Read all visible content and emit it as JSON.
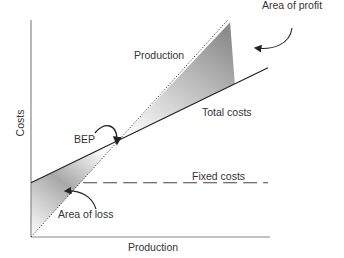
{
  "chart_data": {
    "type": "line",
    "title": "",
    "xlabel": "Production",
    "ylabel": "Costs",
    "grid": false,
    "xlim": [
      0,
      100
    ],
    "ylim": [
      0,
      100
    ],
    "series": [
      {
        "name": "Production",
        "style": "dotted",
        "points": [
          [
            0,
            0
          ],
          [
            83,
            100
          ]
        ]
      },
      {
        "name": "Total costs",
        "style": "solid",
        "points": [
          [
            0,
            25
          ],
          [
            100,
            78
          ]
        ]
      },
      {
        "name": "Fixed costs",
        "style": "dashed",
        "points": [
          [
            22,
            25
          ],
          [
            100,
            25
          ]
        ]
      }
    ],
    "regions": [
      {
        "name": "Area of loss",
        "between": [
          "Total costs",
          "Production"
        ],
        "x_range": [
          0,
          37
        ]
      },
      {
        "name": "Area of profit",
        "between": [
          "Production",
          "Total costs"
        ],
        "x_range": [
          37,
          86
        ]
      }
    ],
    "annotations": [
      {
        "text": "BEP",
        "target": "break-even point",
        "at": [
          37,
          45
        ]
      },
      {
        "text": "Area of profit"
      },
      {
        "text": "Area of loss"
      },
      {
        "text": "Production"
      },
      {
        "text": "Total costs"
      },
      {
        "text": "Fixed costs"
      }
    ]
  },
  "labels": {
    "ylabel": "Costs",
    "xlabel": "Production",
    "production_line": "Production",
    "total_costs": "Total costs",
    "fixed_costs": "Fixed costs",
    "bep": "BEP",
    "area_profit": "Area of profit",
    "area_loss": "Area of loss"
  },
  "colors": {
    "axis": "#888888",
    "line": "#222222",
    "shade_dark": "#8a8a8a",
    "shade_light": "#ffffff"
  }
}
